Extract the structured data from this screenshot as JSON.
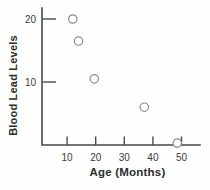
{
  "figure": {
    "background": "#fefefe",
    "axis_color": "#4a4a4a",
    "tick_text_color": "#3a3a3a",
    "label_text_color": "#2e2e2e",
    "point_stroke_color": "#8c8c8c",
    "point_fill_color": "#ffffff"
  },
  "chart_data": {
    "type": "scatter",
    "title": "",
    "xlabel": "Age (Months)",
    "ylabel": "Blood Lead Levels",
    "x_ticks": [
      10,
      20,
      30,
      40,
      50
    ],
    "y_ticks": [
      10,
      20
    ],
    "xlim": [
      0,
      56
    ],
    "ylim": [
      0,
      22
    ],
    "grid": false,
    "legend": null,
    "marker": "open-circle",
    "points": [
      {
        "x": 12,
        "y": 20
      },
      {
        "x": 14,
        "y": 16.5
      },
      {
        "x": 19.5,
        "y": 10.5
      },
      {
        "x": 37,
        "y": 6
      },
      {
        "x": 48.5,
        "y": 0.3
      }
    ]
  }
}
